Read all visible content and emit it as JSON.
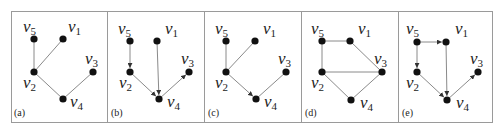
{
  "figure": {
    "width": 502,
    "height": 129,
    "frame": {
      "x": 11,
      "y": 11,
      "width": 481,
      "height": 111
    },
    "dividers": [
      107,
      204,
      301,
      398
    ],
    "colors": {
      "frame": "#9a9a9a",
      "edge": "#8a8a8a",
      "node": "#111111",
      "text": "#222222"
    }
  },
  "panels": [
    {
      "id": "a",
      "label": "(a)",
      "label_pos": [
        14,
        116
      ],
      "nodes": {
        "v1": {
          "x": 63,
          "y": 39,
          "label": "v",
          "sub": "1",
          "lx": 68,
          "ly": 32
        },
        "v2": {
          "x": 34,
          "y": 72,
          "label": "v",
          "sub": "2",
          "lx": 23,
          "ly": 88
        },
        "v3": {
          "x": 93,
          "y": 72,
          "label": "v",
          "sub": "3",
          "lx": 85,
          "ly": 64
        },
        "v4": {
          "x": 63,
          "y": 99,
          "label": "v",
          "sub": "4",
          "lx": 70,
          "ly": 107
        },
        "v5": {
          "x": 34,
          "y": 39,
          "label": "v",
          "sub": "5",
          "lx": 23,
          "ly": 32
        }
      },
      "edges": [
        {
          "from": "v5",
          "to": "v2",
          "directed": false
        },
        {
          "from": "v1",
          "to": "v2",
          "directed": false
        },
        {
          "from": "v2",
          "to": "v4",
          "directed": false
        },
        {
          "from": "v3",
          "to": "v4",
          "directed": false
        }
      ]
    },
    {
      "id": "b",
      "label": "(b)",
      "label_pos": [
        111,
        116
      ],
      "nodes": {
        "v1": {
          "x": 157,
          "y": 41,
          "label": "v",
          "sub": "1",
          "lx": 165,
          "ly": 34
        },
        "v2": {
          "x": 130,
          "y": 72,
          "label": "v",
          "sub": "2",
          "lx": 119,
          "ly": 88
        },
        "v3": {
          "x": 189,
          "y": 72,
          "label": "v",
          "sub": "3",
          "lx": 181,
          "ly": 64
        },
        "v4": {
          "x": 159,
          "y": 99,
          "label": "v",
          "sub": "4",
          "lx": 167,
          "ly": 107
        },
        "v5": {
          "x": 130,
          "y": 41,
          "label": "v",
          "sub": "5",
          "lx": 118,
          "ly": 34
        }
      },
      "edges": [
        {
          "from": "v5",
          "to": "v2",
          "directed": true
        },
        {
          "from": "v1",
          "to": "v4",
          "directed": true
        },
        {
          "from": "v2",
          "to": "v4",
          "directed": true
        },
        {
          "from": "v4",
          "to": "v3",
          "directed": true
        }
      ]
    },
    {
      "id": "c",
      "label": "(c)",
      "label_pos": [
        208,
        116
      ],
      "nodes": {
        "v1": {
          "x": 255,
          "y": 41,
          "label": "v",
          "sub": "1",
          "lx": 263,
          "ly": 34
        },
        "v2": {
          "x": 226,
          "y": 72,
          "label": "v",
          "sub": "2",
          "lx": 215,
          "ly": 88
        },
        "v3": {
          "x": 286,
          "y": 72,
          "label": "v",
          "sub": "3",
          "lx": 278,
          "ly": 64
        },
        "v4": {
          "x": 256,
          "y": 99,
          "label": "v",
          "sub": "4",
          "lx": 264,
          "ly": 107
        },
        "v5": {
          "x": 226,
          "y": 41,
          "label": "v",
          "sub": "5",
          "lx": 215,
          "ly": 34
        }
      },
      "edges": [
        {
          "from": "v5",
          "to": "v2",
          "directed": false
        },
        {
          "from": "v1",
          "to": "v2",
          "directed": false
        },
        {
          "from": "v2",
          "to": "v4",
          "directed": true
        },
        {
          "from": "v3",
          "to": "v4",
          "directed": false
        }
      ]
    },
    {
      "id": "d",
      "label": "(d)",
      "label_pos": [
        305,
        116
      ],
      "nodes": {
        "v1": {
          "x": 350,
          "y": 41,
          "label": "v",
          "sub": "1",
          "lx": 358,
          "ly": 34
        },
        "v2": {
          "x": 322,
          "y": 72,
          "label": "v",
          "sub": "2",
          "lx": 311,
          "ly": 88
        },
        "v3": {
          "x": 382,
          "y": 72,
          "label": "v",
          "sub": "3",
          "lx": 374,
          "ly": 64
        },
        "v4": {
          "x": 351,
          "y": 100,
          "label": "v",
          "sub": "4",
          "lx": 360,
          "ly": 108
        },
        "v5": {
          "x": 322,
          "y": 41,
          "label": "v",
          "sub": "5",
          "lx": 311,
          "ly": 34
        }
      },
      "edges": [
        {
          "from": "v5",
          "to": "v1",
          "directed": false
        },
        {
          "from": "v5",
          "to": "v2",
          "directed": false
        },
        {
          "from": "v1",
          "to": "v3",
          "directed": false
        },
        {
          "from": "v2",
          "to": "v3",
          "directed": false
        },
        {
          "from": "v2",
          "to": "v4",
          "directed": false
        },
        {
          "from": "v3",
          "to": "v4",
          "directed": false
        }
      ]
    },
    {
      "id": "e",
      "label": "(e)",
      "label_pos": [
        402,
        116
      ],
      "nodes": {
        "v1": {
          "x": 446,
          "y": 42,
          "label": "v",
          "sub": "1",
          "lx": 455,
          "ly": 34
        },
        "v2": {
          "x": 417,
          "y": 72,
          "label": "v",
          "sub": "2",
          "lx": 406,
          "ly": 88
        },
        "v3": {
          "x": 478,
          "y": 72,
          "label": "v",
          "sub": "3",
          "lx": 470,
          "ly": 64
        },
        "v4": {
          "x": 447,
          "y": 100,
          "label": "v",
          "sub": "4",
          "lx": 456,
          "ly": 108
        },
        "v5": {
          "x": 417,
          "y": 42,
          "label": "v",
          "sub": "5",
          "lx": 406,
          "ly": 34
        }
      },
      "edges": [
        {
          "from": "v5",
          "to": "v1",
          "directed": true
        },
        {
          "from": "v5",
          "to": "v2",
          "directed": true
        },
        {
          "from": "v1",
          "to": "v4",
          "directed": true
        },
        {
          "from": "v2",
          "to": "v4",
          "directed": true
        },
        {
          "from": "v4",
          "to": "v3",
          "directed": true
        }
      ]
    }
  ]
}
